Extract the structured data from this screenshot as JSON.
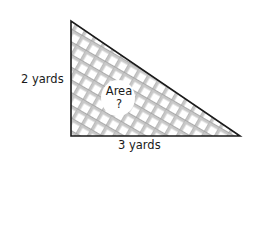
{
  "diagram": {
    "shape": "right-triangle",
    "fill": "crosshatch",
    "labels": {
      "height": "2 yards",
      "base": "3 yards",
      "area_title": "Area",
      "area_value": "?"
    },
    "colors": {
      "outline": "#1a1a1a",
      "hatch_light": "#c8c8c8",
      "hatch_dark": "#555555",
      "background": "#ffffff"
    }
  }
}
